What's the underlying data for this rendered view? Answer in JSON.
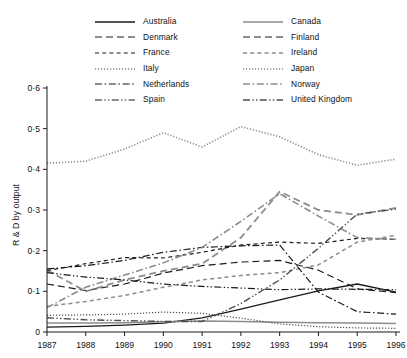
{
  "chart_data": {
    "type": "line",
    "title": "",
    "xlabel": "",
    "ylabel": "R & D by output",
    "x": [
      1987,
      1988,
      1989,
      1990,
      1991,
      1992,
      1993,
      1994,
      1995,
      1996
    ],
    "xtick_labels": [
      "1987",
      "1988",
      "1989",
      "1990",
      "1991",
      "1992",
      "1993",
      "1994",
      "1995",
      "1996"
    ],
    "ytick_labels": [
      "0",
      "0·1",
      "0·2",
      "0·3",
      "0·4",
      "0·5",
      "0·6"
    ],
    "ytick_values": [
      0,
      0.1,
      0.2,
      0.3,
      0.4,
      0.5,
      0.6
    ],
    "ylim": [
      0,
      0.6
    ],
    "xlim": [
      1987,
      1996
    ],
    "grid": false,
    "legend_position": "top",
    "series": [
      {
        "name": "Australia",
        "color": "#1a1a1a",
        "dash": "none",
        "width": 1.3,
        "values": [
          0.012,
          0.014,
          0.017,
          0.022,
          0.035,
          0.056,
          0.079,
          0.101,
          0.118,
          0.098
        ]
      },
      {
        "name": "Canada",
        "color": "#8c8c8c",
        "dash": "none",
        "width": 1.5,
        "values": [
          0.022,
          0.022,
          0.023,
          0.025,
          0.027,
          0.026,
          0.024,
          0.023,
          0.022,
          0.021
        ]
      },
      {
        "name": "Denmark",
        "color": "#1a1a1a",
        "dash": "long",
        "width": 1.2,
        "values": [
          0.118,
          0.102,
          0.118,
          0.145,
          0.163,
          0.172,
          0.176,
          0.152,
          0.106,
          0.097
        ]
      },
      {
        "name": "Finland",
        "color": "#8c8c8c",
        "dash": "long",
        "width": 1.8,
        "values": [
          0.152,
          0.1,
          0.128,
          0.15,
          0.168,
          0.232,
          0.345,
          0.3,
          0.288,
          0.305
        ]
      },
      {
        "name": "France",
        "color": "#1a1a1a",
        "dash": "med",
        "width": 1.2,
        "values": [
          0.151,
          0.168,
          0.183,
          0.182,
          0.196,
          0.214,
          0.221,
          0.218,
          0.23,
          0.228
        ]
      },
      {
        "name": "Ireland",
        "color": "#8c8c8c",
        "dash": "med",
        "width": 1.5,
        "values": [
          0.063,
          0.075,
          0.09,
          0.11,
          0.128,
          0.139,
          0.146,
          0.165,
          0.221,
          0.238
        ]
      },
      {
        "name": "Italy",
        "color": "#4d4d4d",
        "dash": "dot",
        "width": 1.2,
        "values": [
          0.041,
          0.042,
          0.044,
          0.049,
          0.046,
          0.034,
          0.02,
          0.013,
          0.01,
          0.009
        ]
      },
      {
        "name": "Japan",
        "color": "#8c8c8c",
        "dash": "dot",
        "width": 1.6,
        "values": [
          0.415,
          0.42,
          0.45,
          0.49,
          0.455,
          0.505,
          0.48,
          0.436,
          0.41,
          0.425
        ]
      },
      {
        "name": "Netherlands",
        "color": "#1a1a1a",
        "dash": "dashdot",
        "width": 1.2,
        "values": [
          0.155,
          0.163,
          0.176,
          0.196,
          0.208,
          0.212,
          0.214,
          0.098,
          0.05,
          0.044
        ]
      },
      {
        "name": "Norway",
        "color": "#8c8c8c",
        "dash": "dashdot",
        "width": 1.6,
        "values": [
          0.06,
          0.11,
          0.14,
          0.17,
          0.208,
          0.272,
          0.34,
          0.285,
          0.232,
          0.228
        ]
      },
      {
        "name": "Spain",
        "color": "#1a1a1a",
        "dash": "dashdotdot",
        "width": 1.2,
        "values": [
          0.146,
          0.135,
          0.128,
          0.118,
          0.112,
          0.108,
          0.104,
          0.106,
          0.105,
          0.104
        ]
      },
      {
        "name": "United  Kingdom",
        "color": "#4d4d4d",
        "dash": "dashdotdot",
        "width": 1.4,
        "values": [
          0.035,
          0.03,
          0.028,
          0.026,
          0.026,
          0.07,
          0.128,
          0.206,
          0.29,
          0.302
        ]
      }
    ]
  }
}
